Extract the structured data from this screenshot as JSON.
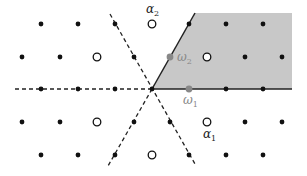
{
  "diagram": {
    "colors": {
      "background": "#ffffff",
      "chamber_fill": "#c8c8c8",
      "dot": "#111111",
      "fundamental_weight": "#888888",
      "line": "#222222",
      "label_dark": "#222222",
      "label_gray": "#888888"
    },
    "origin": [
      152,
      89
    ],
    "chamber_polygon": [
      [
        152,
        89
      ],
      [
        195,
        13
      ],
      [
        292,
        13
      ],
      [
        292,
        89
      ]
    ],
    "solid_walls": [
      {
        "from": [
          152,
          89
        ],
        "to": [
          195,
          13
        ]
      },
      {
        "from": [
          152,
          89
        ],
        "to": [
          292,
          89
        ]
      }
    ],
    "dashed_walls": [
      {
        "from": [
          15,
          89
        ],
        "to": [
          152,
          89
        ]
      },
      {
        "from": [
          110,
          14
        ],
        "to": [
          195,
          164
        ]
      },
      {
        "from": [
          152,
          89
        ],
        "to": [
          108,
          166
        ]
      }
    ],
    "filled_dots": [
      [
        41,
        24
      ],
      [
        78,
        24
      ],
      [
        115,
        24
      ],
      [
        189,
        24
      ],
      [
        226,
        24
      ],
      [
        263,
        24
      ],
      [
        22,
        57
      ],
      [
        60,
        57
      ],
      [
        134,
        57
      ],
      [
        245,
        57
      ],
      [
        282,
        57
      ],
      [
        41,
        89
      ],
      [
        78,
        89
      ],
      [
        115,
        89
      ],
      [
        152,
        89
      ],
      [
        226,
        89
      ],
      [
        263,
        89
      ],
      [
        22,
        122
      ],
      [
        60,
        122
      ],
      [
        134,
        122
      ],
      [
        170,
        122
      ],
      [
        245,
        122
      ],
      [
        282,
        122
      ],
      [
        41,
        155
      ],
      [
        78,
        155
      ],
      [
        115,
        155
      ],
      [
        189,
        155
      ],
      [
        226,
        155
      ],
      [
        263,
        155
      ]
    ],
    "open_circles": [
      [
        152,
        24
      ],
      [
        97,
        57
      ],
      [
        207,
        57
      ],
      [
        97,
        122
      ],
      [
        207,
        122
      ],
      [
        152,
        155
      ]
    ],
    "gray_dots": [
      {
        "pos": [
          170,
          57
        ],
        "name": "omega2"
      },
      {
        "pos": [
          189,
          89
        ],
        "name": "omega1"
      }
    ],
    "labels": {
      "alpha2": {
        "text": "α",
        "sub": "2",
        "x": 146,
        "y": 13,
        "color": "#222222"
      },
      "omega2": {
        "text": "ω",
        "sub": "2",
        "x": 177,
        "y": 61,
        "color": "#888888"
      },
      "omega1": {
        "text": "ω",
        "sub": "1",
        "x": 183,
        "y": 104,
        "color": "#888888"
      },
      "alpha1": {
        "text": "α",
        "sub": "1",
        "x": 203,
        "y": 138,
        "color": "#222222"
      }
    }
  }
}
